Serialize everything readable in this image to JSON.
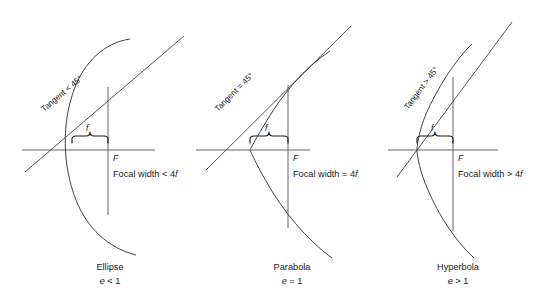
{
  "figure": {
    "axis_y": 150,
    "colors": {
      "curve": "#2b2b2b",
      "axis": "#3a3a3a",
      "tangent": "#2b2b2b",
      "brace": "#1a1a1a",
      "text": "#1a1a1a",
      "background": "#ffffff"
    },
    "panels": [
      {
        "name": "ellipse",
        "caption": "Ellipse",
        "eccentricity_label": "e < 1",
        "eccentricity_symbol": "e",
        "eccentricity_relation": "< 1",
        "tangent_label": "Tangent < 45°",
        "tangent_relation": "<",
        "tangent_angle": "45°",
        "focal_width_label": "Focal width < 4f",
        "focal_width_relation": "<",
        "focal_width_value": "4f",
        "focus_label": "F",
        "f_label": "f",
        "vertex_x": 72,
        "focus_x": 108,
        "axis_left": 22,
        "axis_right": 155,
        "latus_top": 87,
        "latus_bottom": 215,
        "caption_cx": 110,
        "geometry": {
          "type": "ellipse",
          "semi_major": 85,
          "semi_minor": 62,
          "center_x": 157,
          "curve_path": "M 130 39 C 104 43 84 62 74 90 C 62 122 62 165 76 200 C 87 228 108 248 136 255",
          "tangent": "M 25 172 L 184 36",
          "tangent_text_x": 44,
          "tangent_text_y": 112,
          "tangent_text_rotate": -40
        }
      },
      {
        "name": "parabola",
        "caption": "Parabola",
        "eccentricity_label": "e = 1",
        "eccentricity_symbol": "e",
        "eccentricity_relation": "= 1",
        "tangent_label": "Tangent = 45°",
        "tangent_relation": "=",
        "tangent_angle": "45°",
        "focal_width_label": "Focal width = 4f",
        "focal_width_relation": "=",
        "focal_width_value": "4f",
        "focus_label": "F",
        "f_label": "f",
        "vertex_x": 250,
        "focus_x": 288,
        "axis_left": 196,
        "axis_right": 310,
        "latus_top": 85,
        "latus_bottom": 228,
        "caption_cx": 292,
        "geometry": {
          "type": "parabola",
          "focal_length": 38,
          "curve_path": "M 330 51 C 305 67 281 96 266 122 C 255 140 250 150 250 150 C 250 150 255 162 266 181 C 282 210 307 240 332 258",
          "tangent": "M 206 170 L 351 26",
          "tangent_text_x": 218,
          "tangent_text_y": 112,
          "tangent_text_rotate": -45
        }
      },
      {
        "name": "hyperbola",
        "caption": "Hyperbola",
        "eccentricity_label": "e > 1",
        "eccentricity_symbol": "e",
        "eccentricity_relation": "> 1",
        "tangent_label": "Tangent > 45°",
        "tangent_relation": ">",
        "tangent_angle": "45°",
        "focal_width_label": "Focal width > 4f",
        "focal_width_relation": ">",
        "focal_width_value": "4f",
        "focus_label": "F",
        "f_label": "f",
        "vertex_x": 417,
        "focus_x": 453,
        "axis_left": 388,
        "axis_right": 498,
        "latus_top": 77,
        "latus_bottom": 231,
        "caption_cx": 458,
        "geometry": {
          "type": "hyperbola",
          "curve_path": "M 472 44 C 455 60 437 89 426 114 C 419 131 417 146 417 150 C 417 156 420 172 428 190 C 438 214 456 242 474 258",
          "tangent": "M 397 177 L 512 22",
          "tangent_text_x": 408,
          "tangent_text_y": 110,
          "tangent_text_rotate": -53
        }
      }
    ]
  }
}
